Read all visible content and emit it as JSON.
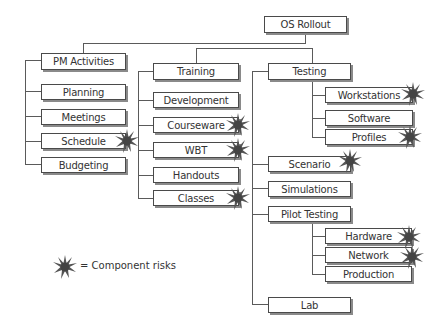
{
  "diagram": {
    "root": {
      "label": "OS Rollout"
    },
    "nodes": {
      "pm_activities": {
        "label": "PM Activities"
      },
      "planning": {
        "label": "Planning"
      },
      "meetings": {
        "label": "Meetings"
      },
      "schedule": {
        "label": "Schedule",
        "risk": true
      },
      "budgeting": {
        "label": "Budgeting"
      },
      "training": {
        "label": "Training"
      },
      "development": {
        "label": "Development"
      },
      "courseware": {
        "label": "Courseware",
        "risk": true
      },
      "wbt": {
        "label": "WBT",
        "risk": true
      },
      "handouts": {
        "label": "Handouts"
      },
      "classes": {
        "label": "Classes",
        "risk": true
      },
      "testing": {
        "label": "Testing"
      },
      "workstations": {
        "label": "Workstations",
        "risk": true
      },
      "software": {
        "label": "Software"
      },
      "profiles": {
        "label": "Profiles",
        "risk": true
      },
      "scenario": {
        "label": "Scenario",
        "risk": true
      },
      "simulations": {
        "label": "Simulations"
      },
      "pilot_testing": {
        "label": "Pilot Testing"
      },
      "hardware": {
        "label": "Hardware",
        "risk": true
      },
      "network": {
        "label": "Network",
        "risk": true
      },
      "production": {
        "label": "Production"
      },
      "lab": {
        "label": "Lab"
      }
    },
    "legend": {
      "icon": "starburst-icon",
      "text": "= Component risks"
    },
    "colors": {
      "line": "#5a5a5a",
      "box_border": "#4a4a4a",
      "shadow": "#8a8a8a",
      "risk_star": "#555555"
    }
  }
}
